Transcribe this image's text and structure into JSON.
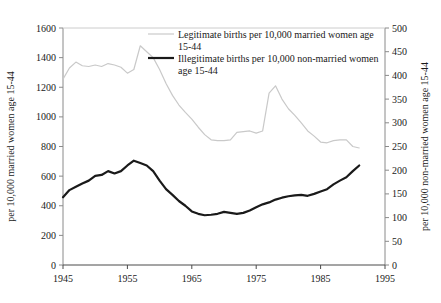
{
  "chart_data": {
    "type": "line",
    "title": "",
    "xlabel": "",
    "grid": false,
    "legend_position": "top-center",
    "x_axis": {
      "min": 1945,
      "max": 1995,
      "ticks": [
        1945,
        1955,
        1965,
        1975,
        1985,
        1995
      ],
      "tick_labels": [
        "1945",
        "1955",
        "1965",
        "1975",
        "1985",
        "1995"
      ]
    },
    "y_axis_left": {
      "label": "per 10,000 married women age 15-44",
      "min": 0,
      "max": 1600,
      "step": 200,
      "ticks": [
        0,
        200,
        400,
        600,
        800,
        1000,
        1200,
        1400,
        1600
      ],
      "tick_labels": [
        "0",
        "200",
        "400",
        "600",
        "800",
        "1000",
        "1200",
        "1400",
        "1600"
      ]
    },
    "y_axis_right": {
      "label": "per 10,000 non-married women age 15-44",
      "min": 0,
      "max": 500,
      "step": 50,
      "ticks": [
        0,
        50,
        100,
        150,
        200,
        250,
        300,
        350,
        400,
        450,
        500
      ],
      "tick_labels": [
        "0",
        "50",
        "100",
        "150",
        "200",
        "250",
        "300",
        "350",
        "400",
        "450",
        "500"
      ]
    },
    "series": [
      {
        "name": "Legitimate births per 10,000 married women age 15-44",
        "legend_label_line1": "Legitimate births per 10,000 married women age",
        "legend_label_line2": "15-44",
        "axis": "left",
        "color": "#c9c9c9",
        "width": 1.2,
        "x": [
          1945,
          1946,
          1947,
          1948,
          1949,
          1950,
          1951,
          1952,
          1953,
          1954,
          1955,
          1956,
          1957,
          1958,
          1959,
          1960,
          1961,
          1962,
          1963,
          1964,
          1965,
          1966,
          1967,
          1968,
          1969,
          1970,
          1971,
          1972,
          1973,
          1974,
          1975,
          1976,
          1977,
          1978,
          1979,
          1980,
          1981,
          1982,
          1983,
          1984,
          1985,
          1986,
          1987,
          1988,
          1989,
          1990,
          1991
        ],
        "values": [
          1255,
          1330,
          1370,
          1345,
          1340,
          1350,
          1340,
          1360,
          1350,
          1335,
          1295,
          1320,
          1480,
          1440,
          1400,
          1320,
          1225,
          1145,
          1080,
          1030,
          985,
          930,
          880,
          845,
          840,
          840,
          845,
          895,
          900,
          905,
          890,
          905,
          1160,
          1210,
          1120,
          1055,
          1010,
          960,
          905,
          870,
          830,
          825,
          840,
          845,
          845,
          800,
          790
        ]
      },
      {
        "name": "Illegitimate births per 10,000 non-married women age 15-44",
        "legend_label_line1": "Illegitimate births per 10,000 non-married women",
        "legend_label_line2": "age 15-44",
        "axis": "right",
        "color": "#1a1a1a",
        "width": 2.2,
        "x": [
          1945,
          1946,
          1947,
          1948,
          1949,
          1950,
          1951,
          1952,
          1953,
          1954,
          1955,
          1956,
          1957,
          1958,
          1959,
          1960,
          1961,
          1962,
          1963,
          1964,
          1965,
          1966,
          1967,
          1968,
          1969,
          1970,
          1971,
          1972,
          1973,
          1974,
          1975,
          1976,
          1977,
          1978,
          1979,
          1980,
          1981,
          1982,
          1983,
          1984,
          1985,
          1986,
          1987,
          1988,
          1989,
          1990,
          1991
        ],
        "values": [
          143,
          158,
          165,
          172,
          178,
          188,
          190,
          198,
          193,
          198,
          210,
          220,
          215,
          210,
          198,
          178,
          160,
          148,
          135,
          125,
          113,
          108,
          105,
          106,
          108,
          112,
          110,
          108,
          110,
          115,
          122,
          128,
          132,
          138,
          142,
          145,
          147,
          148,
          146,
          150,
          155,
          160,
          170,
          178,
          185,
          198,
          210
        ]
      }
    ]
  }
}
